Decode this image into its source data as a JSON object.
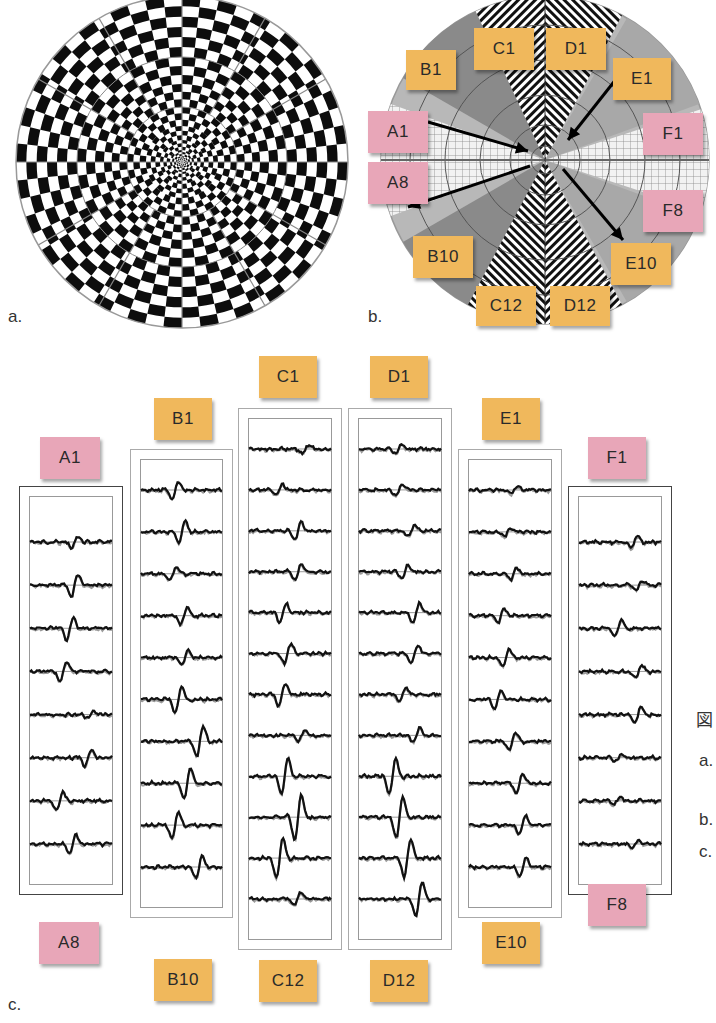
{
  "figure": {
    "panel_labels": {
      "a": "a.",
      "b": "b.",
      "c": "c."
    },
    "side_notes": {
      "kanji": "図",
      "a": "a.",
      "b": "b.",
      "c": "c."
    },
    "colors": {
      "orange_tag": "#f0b85c",
      "pink_tag": "#e8a6b8",
      "trace_black": "#111111",
      "trace_gray": "#9a9a9a"
    }
  },
  "panel_a": {
    "description": "Radial checkerboard stimulus (dartboard pattern)"
  },
  "panel_b": {
    "description": "Stimulus field map with hatched/gray sectors and arrows",
    "tags": [
      {
        "id": "B1",
        "color": "orange"
      },
      {
        "id": "C1",
        "color": "orange"
      },
      {
        "id": "D1",
        "color": "orange"
      },
      {
        "id": "E1",
        "color": "orange"
      },
      {
        "id": "A1",
        "color": "pink"
      },
      {
        "id": "A8",
        "color": "pink"
      },
      {
        "id": "F1",
        "color": "pink"
      },
      {
        "id": "F8",
        "color": "pink"
      },
      {
        "id": "B10",
        "color": "orange"
      },
      {
        "id": "E10",
        "color": "orange"
      },
      {
        "id": "C12",
        "color": "orange"
      },
      {
        "id": "D12",
        "color": "orange"
      }
    ]
  },
  "panel_c": {
    "description": "Multifocal VEP waveform columns",
    "columns": [
      {
        "top": "A1",
        "bottom": "A8",
        "top_color": "pink",
        "traces": 8
      },
      {
        "top": "B1",
        "bottom": "B10",
        "top_color": "orange",
        "traces": 10
      },
      {
        "top": "C1",
        "bottom": "C12",
        "top_color": "orange",
        "traces": 12
      },
      {
        "top": "D1",
        "bottom": "D12",
        "top_color": "orange",
        "traces": 12
      },
      {
        "top": "E1",
        "bottom": "E10",
        "top_color": "orange",
        "traces": 10
      },
      {
        "top": "F1",
        "bottom": "F8",
        "top_color": "pink",
        "traces": 8
      }
    ]
  }
}
